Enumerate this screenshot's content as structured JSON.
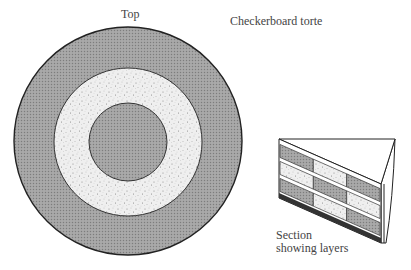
{
  "labels": {
    "top": "Top",
    "title": "Checkerboard torte",
    "section_line1": "Section",
    "section_line2": "showing layers"
  },
  "colors": {
    "dark_layer": "#9a9a9a",
    "light_layer": "#ececec",
    "outline": "#222222"
  },
  "top_view": {
    "rings": [
      "dark",
      "light",
      "dark"
    ]
  },
  "section_view": {
    "rows": [
      [
        "dark",
        "light",
        "dark"
      ],
      [
        "light",
        "dark",
        "light"
      ],
      [
        "dark",
        "light",
        "dark"
      ]
    ]
  }
}
